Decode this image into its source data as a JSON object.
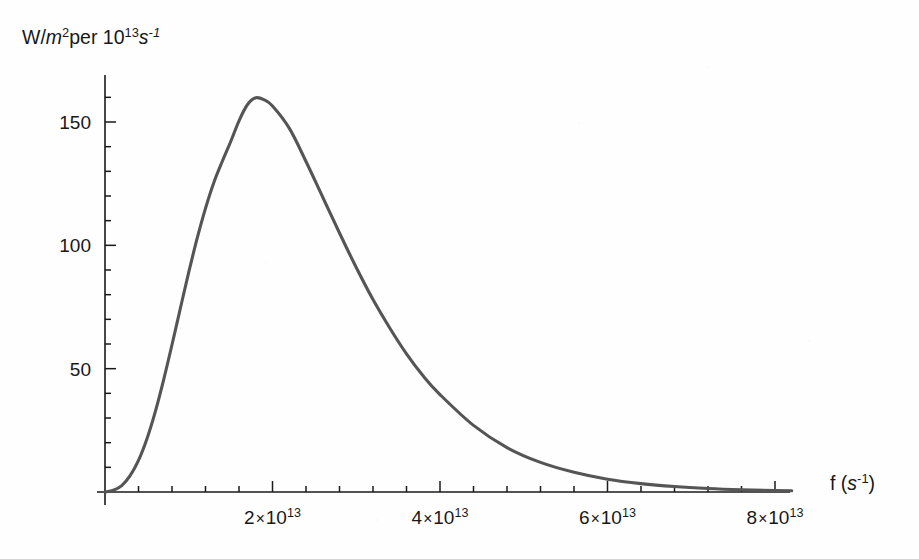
{
  "figure": {
    "background_color": "#fefefe",
    "curve_color": "#555555",
    "axis_color": "#1a1a1a"
  },
  "labels": {
    "y_axis": {
      "full_text": "W/m² per 10¹³ s⁻¹",
      "part_w_slash": "W/",
      "part_m": "m",
      "part_m_exp": "2",
      "part_per": "per 10",
      "part_ten_exp": "13",
      "part_s": "s",
      "part_s_exp": "-1"
    },
    "x_axis": {
      "full_text": "f (s⁻¹)",
      "part_f": "f (",
      "part_s": "s",
      "part_s_exp": "-1",
      "part_close": ")"
    }
  },
  "y_ticks": [
    {
      "value": 50,
      "label": "50"
    },
    {
      "value": 100,
      "label": "100"
    },
    {
      "value": 150,
      "label": "150"
    }
  ],
  "x_ticks": [
    {
      "value": 2,
      "mantissa": "2",
      "times": "×",
      "base": "10",
      "exponent": "13",
      "label": "2 × 10¹³"
    },
    {
      "value": 4,
      "mantissa": "4",
      "times": "×",
      "base": "10",
      "exponent": "13",
      "label": "4 × 10¹³"
    },
    {
      "value": 6,
      "mantissa": "6",
      "times": "×",
      "base": "10",
      "exponent": "13",
      "label": "6 × 10¹³"
    },
    {
      "value": 8,
      "mantissa": "8",
      "times": "×",
      "base": "10",
      "exponent": "13",
      "label": "8 × 10¹³"
    }
  ],
  "chart_data": {
    "type": "line",
    "title": "",
    "xlabel": "f (s^-1)",
    "ylabel": "W/m^2 per 10^13 s^-1",
    "xlim": [
      0,
      8.2
    ],
    "ylim": [
      0,
      168
    ],
    "x_unit": "10^13 s^-1",
    "y_unit": "W/m^2 per 10^13 s^-1",
    "grid": false,
    "legend": null,
    "x_major_ticks": [
      2,
      4,
      6,
      8
    ],
    "x_minor_tick_step": 0.4,
    "y_major_ticks": [
      50,
      100,
      150
    ],
    "y_minor_tick_step": 10,
    "peak": {
      "x": 1.71,
      "y": 160
    },
    "series": [
      {
        "name": "spectral radiant exitance",
        "x": [
          0,
          0.1,
          0.2,
          0.3,
          0.4,
          0.5,
          0.6,
          0.7,
          0.8,
          0.9,
          1.0,
          1.1,
          1.2,
          1.3,
          1.4,
          1.5,
          1.6,
          1.7,
          1.8,
          1.9,
          2.0,
          2.2,
          2.4,
          2.6,
          2.8,
          3.0,
          3.2,
          3.4,
          3.6,
          3.8,
          4.0,
          4.4,
          4.8,
          5.2,
          5.6,
          6.0,
          6.4,
          6.8,
          7.2,
          7.6,
          8.0,
          8.2
        ],
        "y": [
          0.0,
          0.7,
          2.6,
          6.6,
          12.8,
          21.5,
          32.5,
          45.5,
          59.7,
          74.5,
          89.1,
          102.8,
          115.0,
          125.5,
          134.0,
          142.0,
          150.5,
          157.0,
          159.8,
          159.0,
          156.5,
          147.5,
          134.0,
          119.5,
          105.0,
          91.0,
          78.0,
          66.5,
          56.0,
          47.0,
          39.5,
          27.0,
          18.0,
          12.0,
          8.0,
          5.2,
          3.4,
          2.2,
          1.4,
          0.9,
          0.6,
          0.5
        ]
      }
    ]
  }
}
